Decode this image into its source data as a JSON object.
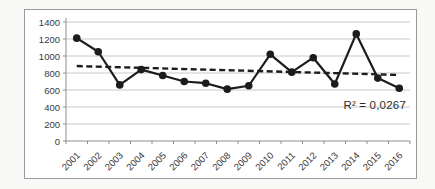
{
  "chart_data": {
    "type": "line",
    "title": "",
    "xlabel": "",
    "ylabel": "",
    "categories": [
      "2001",
      "2002",
      "2003",
      "2004",
      "2005",
      "2006",
      "2007",
      "2008",
      "2009",
      "2010",
      "2011",
      "2012",
      "2013",
      "2014",
      "2015",
      "2016"
    ],
    "series": [
      {
        "name": "annual-values",
        "values": [
          1210,
          1050,
          660,
          840,
          770,
          700,
          680,
          610,
          650,
          1020,
          810,
          980,
          670,
          1260,
          740,
          620
        ],
        "marker": "filled-circle"
      }
    ],
    "ylim": [
      0,
      1400
    ],
    "yticks": [
      0,
      200,
      400,
      600,
      800,
      1000,
      1200,
      1400
    ],
    "grid": true,
    "legend": "none",
    "trendline": {
      "style": "dashed",
      "fit": "linear"
    },
    "annotation": "R² = 0,0267",
    "r_squared": 0.0267,
    "colors": {
      "line": "#1c1c1c",
      "marker": "#1c1c1c",
      "trendline": "#1c1c1c",
      "gridline": "#c9c9c9",
      "axis": "#8e8e8e",
      "tick_text": "#3a3a3a",
      "frame_border": "#9a9a9a",
      "plot_background": "#ffffff",
      "page_background": "#f8f8f6"
    }
  }
}
